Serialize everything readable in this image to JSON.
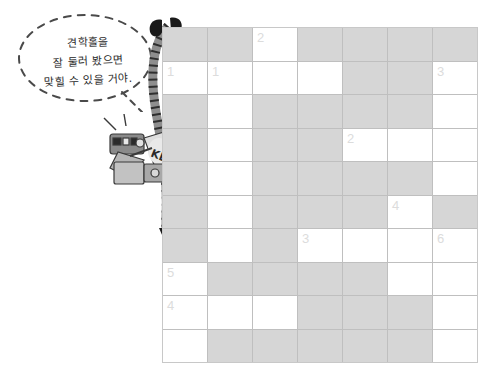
{
  "speech_bubble": {
    "name": "hint-speech-bubble",
    "lines": [
      "견학홀을",
      "잘 둘러 봤으면",
      "맞힐 수 있을 거야."
    ]
  },
  "illustration": {
    "camera_label": "KBS",
    "camera_name": "tv-broadcast-camera",
    "cable_name": "camera-cable"
  },
  "crossword": {
    "columns": 7,
    "rows": 10,
    "colors": {
      "shaded": "#d6d6d6",
      "open": "#ffffff",
      "gridline": "#bfbfbf",
      "number": "#dcdcdc"
    },
    "cells": [
      [
        {
          "shaded": true,
          "num": ""
        },
        {
          "shaded": true,
          "num": ""
        },
        {
          "shaded": false,
          "num": "2"
        },
        {
          "shaded": true,
          "num": ""
        },
        {
          "shaded": true,
          "num": ""
        },
        {
          "shaded": true,
          "num": ""
        },
        {
          "shaded": true,
          "num": ""
        }
      ],
      [
        {
          "shaded": false,
          "num": "1"
        },
        {
          "shaded": false,
          "num": "1"
        },
        {
          "shaded": false,
          "num": ""
        },
        {
          "shaded": false,
          "num": ""
        },
        {
          "shaded": true,
          "num": ""
        },
        {
          "shaded": true,
          "num": ""
        },
        {
          "shaded": false,
          "num": "3"
        }
      ],
      [
        {
          "shaded": true,
          "num": ""
        },
        {
          "shaded": false,
          "num": ""
        },
        {
          "shaded": true,
          "num": ""
        },
        {
          "shaded": true,
          "num": ""
        },
        {
          "shaded": true,
          "num": ""
        },
        {
          "shaded": true,
          "num": ""
        },
        {
          "shaded": false,
          "num": ""
        }
      ],
      [
        {
          "shaded": true,
          "num": ""
        },
        {
          "shaded": false,
          "num": ""
        },
        {
          "shaded": true,
          "num": ""
        },
        {
          "shaded": true,
          "num": ""
        },
        {
          "shaded": false,
          "num": "2"
        },
        {
          "shaded": false,
          "num": ""
        },
        {
          "shaded": false,
          "num": ""
        }
      ],
      [
        {
          "shaded": true,
          "num": ""
        },
        {
          "shaded": false,
          "num": ""
        },
        {
          "shaded": true,
          "num": ""
        },
        {
          "shaded": true,
          "num": ""
        },
        {
          "shaded": true,
          "num": ""
        },
        {
          "shaded": true,
          "num": ""
        },
        {
          "shaded": false,
          "num": ""
        }
      ],
      [
        {
          "shaded": true,
          "num": ""
        },
        {
          "shaded": false,
          "num": ""
        },
        {
          "shaded": true,
          "num": ""
        },
        {
          "shaded": true,
          "num": ""
        },
        {
          "shaded": true,
          "num": ""
        },
        {
          "shaded": false,
          "num": "4"
        },
        {
          "shaded": true,
          "num": ""
        }
      ],
      [
        {
          "shaded": true,
          "num": ""
        },
        {
          "shaded": false,
          "num": ""
        },
        {
          "shaded": true,
          "num": ""
        },
        {
          "shaded": false,
          "num": "3"
        },
        {
          "shaded": false,
          "num": ""
        },
        {
          "shaded": false,
          "num": ""
        },
        {
          "shaded": false,
          "num": "6"
        }
      ],
      [
        {
          "shaded": false,
          "num": "5"
        },
        {
          "shaded": true,
          "num": ""
        },
        {
          "shaded": true,
          "num": ""
        },
        {
          "shaded": true,
          "num": ""
        },
        {
          "shaded": true,
          "num": ""
        },
        {
          "shaded": false,
          "num": ""
        },
        {
          "shaded": false,
          "num": ""
        }
      ],
      [
        {
          "shaded": false,
          "num": "4"
        },
        {
          "shaded": false,
          "num": ""
        },
        {
          "shaded": false,
          "num": ""
        },
        {
          "shaded": true,
          "num": ""
        },
        {
          "shaded": true,
          "num": ""
        },
        {
          "shaded": true,
          "num": ""
        },
        {
          "shaded": false,
          "num": ""
        }
      ],
      [
        {
          "shaded": false,
          "num": ""
        },
        {
          "shaded": true,
          "num": ""
        },
        {
          "shaded": true,
          "num": ""
        },
        {
          "shaded": true,
          "num": ""
        },
        {
          "shaded": true,
          "num": ""
        },
        {
          "shaded": true,
          "num": ""
        },
        {
          "shaded": false,
          "num": ""
        }
      ]
    ]
  }
}
